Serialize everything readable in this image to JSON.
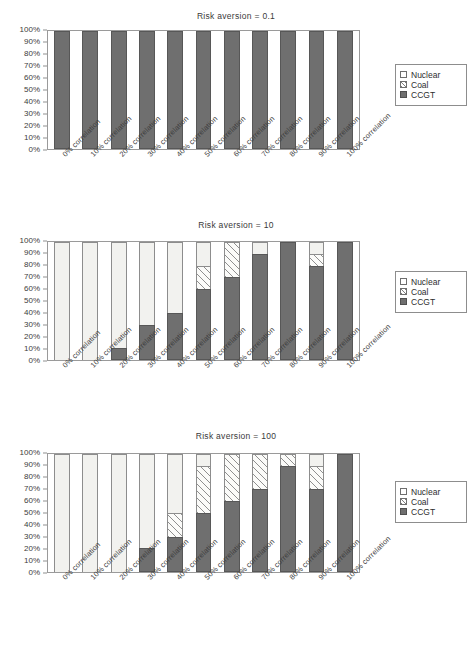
{
  "figure": {
    "legend_entries": [
      {
        "key": "nuclear",
        "label": "Nuclear",
        "swatch": "white-square-icon"
      },
      {
        "key": "coal",
        "label": "Coal",
        "swatch": "hatched-square-icon"
      },
      {
        "key": "ccgt",
        "label": "CCGT",
        "swatch": "filled-square-icon"
      }
    ],
    "y_ticks": [
      "100%",
      "90%",
      "80%",
      "70%",
      "60%",
      "50%",
      "40%",
      "30%",
      "20%",
      "10%",
      "0%"
    ],
    "categories": [
      "0% correlation",
      "10% correlation",
      "20% correlation",
      "30% correlation",
      "40% correlation",
      "50% correlation",
      "60% correlation",
      "70% correlation",
      "80% correlation",
      "90% correlation",
      "100% correlation"
    ],
    "colors": {
      "ccgt": "#6f6f6f",
      "nuclear": "#f2f2ef",
      "coal_hatch": "#8f8f8f",
      "axis": "#9a9a9a",
      "text": "#3c3c3c"
    }
  },
  "chart_data": [
    {
      "type": "bar",
      "stacked": true,
      "percent": true,
      "title": "Risk aversion = 0.1",
      "xlabel": "",
      "ylabel": "",
      "ylim": [
        0,
        100
      ],
      "grid": false,
      "legend_position": "right",
      "categories": [
        "0% correlation",
        "10% correlation",
        "20% correlation",
        "30% correlation",
        "40% correlation",
        "50% correlation",
        "60% correlation",
        "70% correlation",
        "80% correlation",
        "90% correlation",
        "100% correlation"
      ],
      "series": [
        {
          "name": "CCGT",
          "values": [
            100,
            100,
            100,
            100,
            100,
            100,
            100,
            100,
            100,
            100,
            100
          ]
        },
        {
          "name": "Coal",
          "values": [
            0,
            0,
            0,
            0,
            0,
            0,
            0,
            0,
            0,
            0,
            0
          ]
        },
        {
          "name": "Nuclear",
          "values": [
            0,
            0,
            0,
            0,
            0,
            0,
            0,
            0,
            0,
            0,
            0
          ]
        }
      ]
    },
    {
      "type": "bar",
      "stacked": true,
      "percent": true,
      "title": "Risk aversion = 10",
      "xlabel": "",
      "ylabel": "",
      "ylim": [
        0,
        100
      ],
      "grid": false,
      "legend_position": "right",
      "categories": [
        "0% correlation",
        "10% correlation",
        "20% correlation",
        "30% correlation",
        "40% correlation",
        "50% correlation",
        "60% correlation",
        "70% correlation",
        "80% correlation",
        "90% correlation",
        "100% correlation"
      ],
      "series": [
        {
          "name": "CCGT",
          "values": [
            0,
            0,
            10,
            30,
            40,
            60,
            70,
            90,
            100,
            80,
            100
          ]
        },
        {
          "name": "Coal",
          "values": [
            0,
            0,
            0,
            0,
            0,
            20,
            30,
            0,
            0,
            10,
            0
          ]
        },
        {
          "name": "Nuclear",
          "values": [
            100,
            100,
            90,
            70,
            60,
            20,
            0,
            10,
            0,
            10,
            0
          ]
        }
      ]
    },
    {
      "type": "bar",
      "stacked": true,
      "percent": true,
      "title": "Risk aversion = 100",
      "xlabel": "",
      "ylabel": "",
      "ylim": [
        0,
        100
      ],
      "grid": false,
      "legend_position": "right",
      "categories": [
        "0% correlation",
        "10% correlation",
        "20% correlation",
        "30% correlation",
        "40% correlation",
        "50% correlation",
        "60% correlation",
        "70% correlation",
        "80% correlation",
        "90% correlation",
        "100% correlation"
      ],
      "series": [
        {
          "name": "CCGT",
          "values": [
            0,
            0,
            0,
            20,
            30,
            50,
            60,
            70,
            90,
            70,
            100
          ]
        },
        {
          "name": "Coal",
          "values": [
            0,
            0,
            0,
            0,
            20,
            40,
            40,
            30,
            10,
            20,
            0
          ]
        },
        {
          "name": "Nuclear",
          "values": [
            100,
            100,
            100,
            80,
            50,
            10,
            0,
            0,
            0,
            10,
            0
          ]
        }
      ]
    }
  ]
}
